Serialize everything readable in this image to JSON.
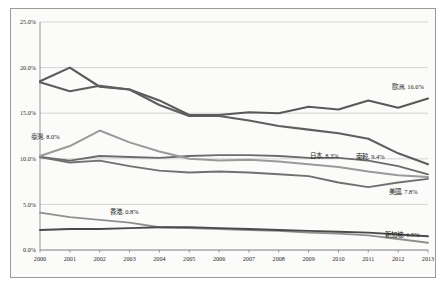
{
  "chart_data": {
    "type": "line",
    "title": "",
    "xlabel": "",
    "ylabel": "",
    "x": [
      2000,
      2001,
      2002,
      2003,
      2004,
      2005,
      2006,
      2007,
      2008,
      2009,
      2010,
      2011,
      2012,
      2013
    ],
    "xtick_labels": [
      "2000",
      "2001",
      "2002",
      "2003",
      "2004",
      "2005",
      "2006",
      "2007",
      "2008",
      "2009",
      "2010",
      "2011",
      "2012",
      "2013"
    ],
    "ylim": [
      0.0,
      25.0
    ],
    "ytick_labels": [
      "0.0%",
      "5.0%",
      "10.0%",
      "15.0%",
      "20.0%",
      "25.0%"
    ],
    "ytick_values": [
      0.0,
      5.0,
      10.0,
      15.0,
      20.0,
      25.0
    ],
    "grid": true,
    "legend": "inline-end-labels",
    "series": [
      {
        "name": "歐洲",
        "end_label": "歐洲, 16.6%",
        "end_value": 16.6,
        "color": "#595959",
        "width": 2.1,
        "values": [
          18.5,
          20.0,
          17.9,
          17.6,
          16.4,
          14.8,
          14.8,
          15.1,
          15.0,
          15.7,
          15.4,
          16.4,
          15.6,
          16.6
        ]
      },
      {
        "name": "南韓",
        "end_label": "南韓, 9.4%",
        "end_value": 9.4,
        "color": "#5e5e5e",
        "width": 2.1,
        "values": [
          18.4,
          17.4,
          18.0,
          17.6,
          15.9,
          14.7,
          14.7,
          14.2,
          13.6,
          13.2,
          12.8,
          12.2,
          10.6,
          9.4
        ]
      },
      {
        "name": "日本",
        "end_label": "日本, 8.3%",
        "end_value": 8.3,
        "color": "#6b6b6b",
        "width": 1.9,
        "values": [
          10.2,
          9.8,
          10.3,
          10.2,
          10.1,
          10.3,
          10.4,
          10.4,
          10.3,
          10.1,
          10.1,
          9.8,
          9.2,
          8.3
        ]
      },
      {
        "name": "美國",
        "end_label": "美國, 7.8%",
        "end_value": 7.8,
        "color": "#707070",
        "width": 1.9,
        "values": [
          10.2,
          9.6,
          9.8,
          9.2,
          8.7,
          8.5,
          8.6,
          8.5,
          8.3,
          8.1,
          7.4,
          6.9,
          7.4,
          7.8
        ]
      },
      {
        "name": "臺灣",
        "end_label": "臺灣, 8.0%",
        "end_value": 8.0,
        "color": "#9a9a9a",
        "width": 2.0,
        "values": [
          10.3,
          11.4,
          13.1,
          11.8,
          10.8,
          10.0,
          9.8,
          9.9,
          9.7,
          9.4,
          9.1,
          8.6,
          8.2,
          8.0
        ]
      },
      {
        "name": "香港",
        "end_label": "香港, 0.8%",
        "end_value": 0.8,
        "color": "#8f8f8f",
        "width": 1.9,
        "values": [
          4.1,
          3.6,
          3.3,
          3.0,
          2.5,
          2.4,
          2.3,
          2.2,
          2.1,
          1.9,
          1.8,
          1.6,
          1.2,
          0.8
        ]
      },
      {
        "name": "新加坡",
        "end_label": "新加坡, 1.5%",
        "end_value": 1.5,
        "color": "#4a4a4a",
        "width": 1.9,
        "values": [
          2.2,
          2.3,
          2.3,
          2.4,
          2.5,
          2.5,
          2.4,
          2.3,
          2.2,
          2.1,
          2.0,
          1.9,
          1.7,
          1.5
        ]
      }
    ],
    "annotations": [
      {
        "text": "歐洲, 16.6%",
        "x": 392,
        "y": 89,
        "name": "label-europe"
      },
      {
        "text": "南韓, 9.4%",
        "x": 356,
        "y": 159,
        "name": "label-south-korea"
      },
      {
        "text": "日本, 8.3%",
        "x": 310,
        "y": 158,
        "name": "label-japan"
      },
      {
        "text": "美國, 7.8%",
        "x": 389,
        "y": 194,
        "name": "label-usa"
      },
      {
        "text": "臺灣, 8.0%",
        "x": 31,
        "y": 139,
        "name": "label-taiwan"
      },
      {
        "text": "香港, 0.8%",
        "x": 110,
        "y": 214,
        "name": "label-hong-kong"
      },
      {
        "text": "新加坡, 1.5%",
        "x": 385,
        "y": 237,
        "name": "label-singapore"
      }
    ]
  }
}
